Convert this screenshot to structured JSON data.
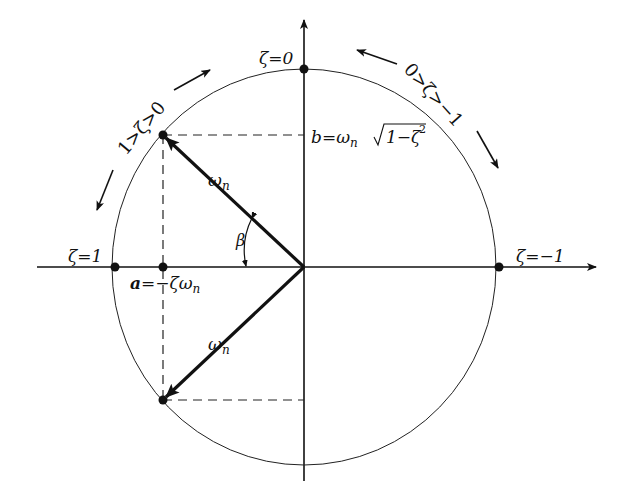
{
  "diagram": {
    "colors": {
      "ink": "#111111",
      "background": "#ffffff"
    },
    "axes": {
      "real_axis": {
        "direction": "right"
      },
      "imag_axis": {
        "direction": "up"
      }
    },
    "circle": {
      "radius_label": "ωn"
    },
    "points": {
      "zeta_zero": {
        "label": "ζ=0"
      },
      "zeta_one": {
        "label": "ζ=1"
      },
      "zeta_minus_one": {
        "label": "ζ=−1"
      },
      "a_point": {
        "label_prefix": "a",
        "label_rest": "=−ζω",
        "label_sub": "n"
      }
    },
    "b_label": {
      "prefix": "b",
      "eq": "=ω",
      "sub": "n",
      "radical": "1−ζ",
      "sup": "2"
    },
    "vectors": {
      "upper": {
        "label": "ω",
        "sub": "n"
      },
      "lower": {
        "label": "ω",
        "sub": "n"
      }
    },
    "angle": {
      "label": "β"
    },
    "ranges": {
      "left": {
        "label": "1>ζ>0"
      },
      "right": {
        "label": "0>ζ>−1"
      }
    }
  }
}
